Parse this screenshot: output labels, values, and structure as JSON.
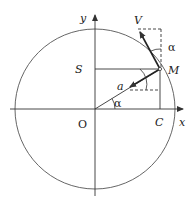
{
  "diagram": {
    "labels": {
      "y_axis": "y",
      "x_axis": "x",
      "origin": "O",
      "point_m": "M",
      "point_s": "S",
      "point_c": "C",
      "velocity": "V",
      "acceleration": "a",
      "angle_at_origin": "α",
      "angle_at_velocity": "α"
    },
    "geometry": {
      "origin": [
        95,
        109
      ],
      "radius": 80,
      "point_m": [
        160,
        69
      ],
      "velocity_tip": [
        138,
        29
      ],
      "acceleration_tip": [
        128,
        88
      ]
    },
    "colors": {
      "stroke": "#333333",
      "text": "#222222"
    }
  }
}
